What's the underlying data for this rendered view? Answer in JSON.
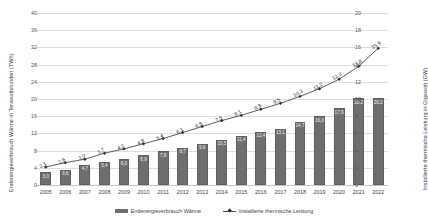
{
  "chart_data": {
    "type": "bar",
    "title": "",
    "categories": [
      "2005",
      "2006",
      "2007",
      "2008",
      "2009",
      "2010",
      "2011",
      "2012",
      "2013",
      "2014",
      "2015",
      "2016",
      "2017",
      "2018",
      "2019",
      "2020",
      "2021",
      "2022"
    ],
    "series": [
      {
        "name": "Endenergieverbrauch Wärme",
        "type": "bar",
        "axis": "left",
        "unit": "TWh",
        "values": [
          3.0,
          3.6,
          4.7,
          5.4,
          6.0,
          6.9,
          7.8,
          8.7,
          9.6,
          10.5,
          11.4,
          12.4,
          13.1,
          14.7,
          16.0,
          17.9,
          20.2,
          20.2
        ],
        "labels": [
          "3,0",
          "3,6",
          "4,7",
          "5,4",
          "6,0",
          "6,9",
          "7,8",
          "8,7",
          "9,6",
          "10,5",
          "11,4",
          "12,4",
          "13,1",
          "14,7",
          "16,0",
          "17,9",
          "20,2",
          "20,2"
        ]
      },
      {
        "name": "Installierte thermische Leistung",
        "type": "line",
        "axis": "right",
        "unit": "GW",
        "values": [
          2.1,
          2.6,
          3.0,
          3.7,
          4.2,
          4.8,
          5.4,
          6.1,
          6.8,
          7.5,
          8.1,
          8.8,
          9.5,
          10.3,
          11.2,
          12.3,
          13.8,
          15.9
        ],
        "labels": [
          "2,1",
          "2,6",
          "3,0",
          "3,7",
          "4,2",
          "4,8",
          "5,4",
          "6,1",
          "6,8",
          "7,5",
          "8,1",
          "8,8",
          "9,5",
          "10,3",
          "11,2",
          "12,3",
          "13,8",
          "15,9"
        ]
      }
    ],
    "xlabel": "",
    "ylabel": "Endenergieverbrauch Wärme in Terawattstunden (TWh)",
    "y2label": "Installierte thermische Leistung in Gigawatt (GW)",
    "ylim": [
      0,
      40
    ],
    "y2lim": [
      0,
      20
    ],
    "yticks": [
      "0",
      "4",
      "8",
      "12",
      "16",
      "20",
      "24",
      "28",
      "32",
      "36",
      "40"
    ],
    "y2ticks": [
      "0",
      "2",
      "4",
      "6",
      "8",
      "10",
      "12",
      "14",
      "16",
      "18",
      "20"
    ],
    "grid": true,
    "legend_position": "bottom",
    "colors": {
      "bar": "#6e6e6e",
      "line": "#4a4a4a",
      "marker": "#2f2f2f",
      "grid": "#dedede",
      "text": "#3f3f3f"
    }
  },
  "legend": {
    "bar_label": "Endenergieverbrauch Wärme",
    "line_label": "Installierte thermische Leistung"
  }
}
